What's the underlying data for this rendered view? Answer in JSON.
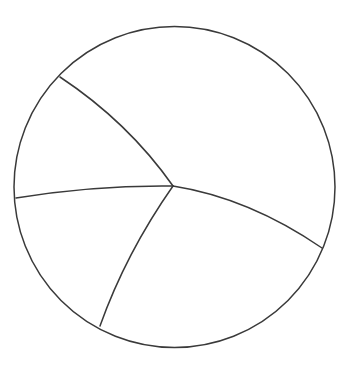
{
  "figure": {
    "background_color": "#ffffff",
    "stroke_color": "#3a3a3a",
    "stroke_width": 1.5,
    "canvas": {
      "width": 350,
      "height": 370
    }
  },
  "boundary": {
    "name": "boundary-circle",
    "center_x": 174.5,
    "center_y": 187,
    "radius": 160.5,
    "stroke_color": "#3a3a3a",
    "stroke_width": 1.5
  },
  "vertex": {
    "name": "central-vertex",
    "x": 173,
    "y": 186,
    "degree": 4
  },
  "arcs": [
    {
      "id": "arc-upper-left",
      "label": "Arc NW",
      "start_x": 60,
      "start_y": 77,
      "end_x": 173,
      "end_y": 186,
      "control_x": 128,
      "control_y": 122,
      "bulge_direction": "upper-right",
      "path": "M 60 77 Q 128 122 173 186"
    },
    {
      "id": "arc-left",
      "label": "Arc W",
      "start_x": 16,
      "start_y": 198,
      "end_x": 173,
      "end_y": 186,
      "control_x": 95,
      "control_y": 185,
      "bulge_direction": "up",
      "path": "M 16 198 Q 95 185 173 186"
    },
    {
      "id": "arc-lower",
      "label": "Arc S",
      "start_x": 173,
      "start_y": 186,
      "end_x": 100,
      "end_y": 326,
      "control_x": 126,
      "control_y": 253,
      "bulge_direction": "left",
      "path": "M 173 186 Q 126 253 100 326"
    },
    {
      "id": "arc-right",
      "label": "Arc E",
      "start_x": 173,
      "start_y": 186,
      "end_x": 322,
      "end_y": 248,
      "control_x": 249,
      "control_y": 198,
      "bulge_direction": "up",
      "path": "M 173 186 Q 249 198 322 248"
    }
  ],
  "regions": [
    {
      "id": "region-top",
      "label": "Region I (upper)"
    },
    {
      "id": "region-left",
      "label": "Region II (left)"
    },
    {
      "id": "region-bottom",
      "label": "Region III (lower)"
    },
    {
      "id": "region-right",
      "label": "Region IV (right)"
    }
  ],
  "chart_data": {
    "type": "diagram",
    "shape": "circle",
    "arc_count": 4,
    "region_count": 4,
    "boundary_intersections": [
      {
        "x": 60,
        "y": 77,
        "position": "upper-left"
      },
      {
        "x": 16,
        "y": 198,
        "position": "left"
      },
      {
        "x": 100,
        "y": 326,
        "position": "lower-left"
      },
      {
        "x": 322,
        "y": 248,
        "position": "right"
      }
    ]
  }
}
